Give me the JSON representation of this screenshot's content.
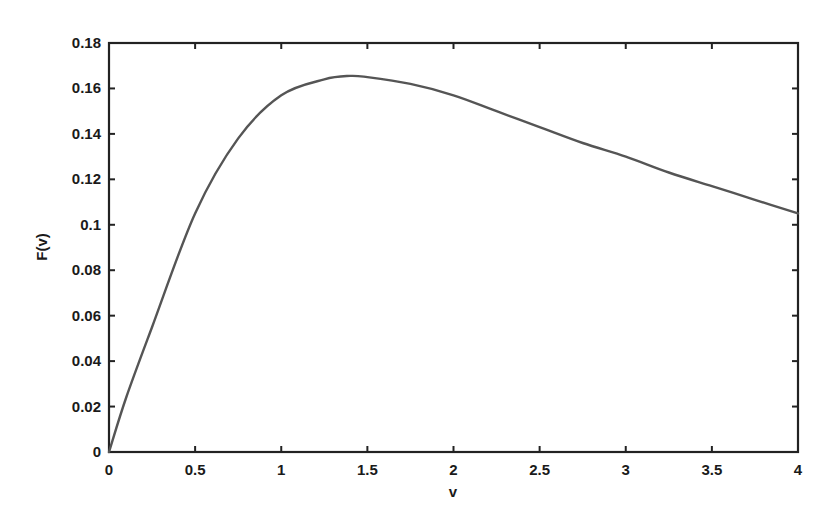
{
  "chart_data": {
    "type": "line",
    "title": "",
    "xlabel": "v",
    "ylabel": "F(v)",
    "xlim": [
      0,
      4
    ],
    "ylim": [
      0,
      0.18
    ],
    "grid": false,
    "legend": null,
    "x_ticks": [
      0,
      0.5,
      1,
      1.5,
      2,
      2.5,
      3,
      3.5,
      4
    ],
    "x_tick_labels": [
      "0",
      "0.5",
      "1",
      "1.5",
      "2",
      "2.5",
      "3",
      "3.5",
      "4"
    ],
    "y_ticks": [
      0,
      0.02,
      0.04,
      0.06,
      0.08,
      0.1,
      0.12,
      0.14,
      0.16,
      0.18
    ],
    "y_tick_labels": [
      "0",
      "0.02",
      "0.04",
      "0.06",
      "0.08",
      "0.1",
      "0.12",
      "0.14",
      "0.16",
      "0.18"
    ],
    "series": [
      {
        "name": "F(v)",
        "color": "#555555",
        "x": [
          0,
          0.1,
          0.25,
          0.5,
          0.75,
          1.0,
          1.25,
          1.4,
          1.5,
          1.75,
          2.0,
          2.25,
          2.5,
          2.75,
          3.0,
          3.25,
          3.5,
          3.75,
          4.0
        ],
        "y": [
          0,
          0.024,
          0.055,
          0.105,
          0.138,
          0.157,
          0.164,
          0.1655,
          0.165,
          0.162,
          0.157,
          0.15,
          0.143,
          0.136,
          0.13,
          0.123,
          0.117,
          0.111,
          0.105
        ]
      }
    ]
  }
}
